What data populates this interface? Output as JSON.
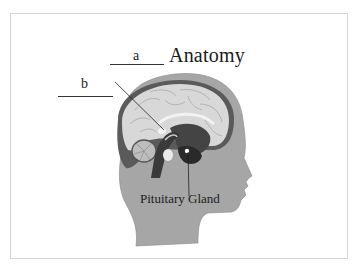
{
  "diagram": {
    "title": "Anatomy",
    "blanks": [
      {
        "id": "a",
        "label": "a"
      },
      {
        "id": "b",
        "label": "b"
      }
    ],
    "callouts": [
      {
        "label": "Pituitary Gland"
      }
    ],
    "colors": {
      "head": "#a8a8a8",
      "cortex": "#d6d6d6",
      "dark_structures": "#3a3a3a",
      "lines": "#222222"
    }
  }
}
